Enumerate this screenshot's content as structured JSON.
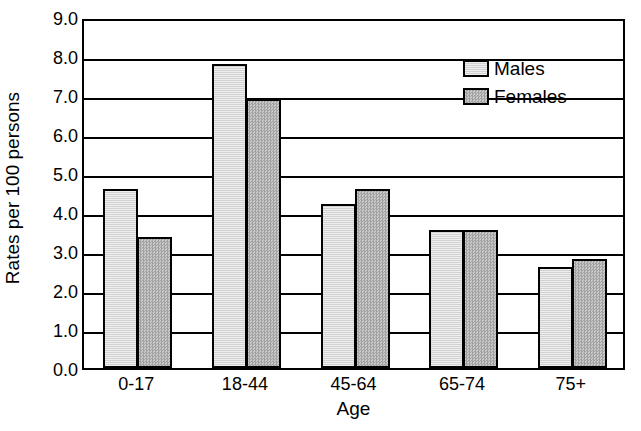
{
  "chart_data": {
    "type": "bar",
    "title": "",
    "subtitle": "",
    "xlabel": "Age",
    "ylabel": "Rates per 100 persons",
    "categories": [
      "0-17",
      "18-44",
      "45-64",
      "65-74",
      "75+"
    ],
    "series": [
      {
        "name": "Males",
        "values": [
          4.6,
          7.8,
          4.2,
          3.55,
          2.6
        ]
      },
      {
        "name": "Females",
        "values": [
          3.35,
          6.9,
          4.6,
          3.55,
          2.8
        ]
      }
    ],
    "legend": [
      "Males",
      "Females"
    ],
    "legend_position": "inside top-right",
    "ylim": [
      0.0,
      9.0
    ],
    "ytick_values": [
      9.0,
      8.0,
      7.0,
      6.0,
      5.0,
      4.0,
      3.0,
      2.0,
      1.0,
      0.0
    ],
    "ytick_labels": [
      "9.0",
      "8.0",
      "7.0",
      "6.0",
      "5.0",
      "4.0",
      "3.0",
      "2.0",
      "1.0",
      "0.0"
    ],
    "grid": true,
    "grid_axis": "y",
    "colors": {
      "males": "#d9d9d9",
      "females": "#b0b0b0",
      "axis": "#000000",
      "background": "#ffffff"
    }
  }
}
